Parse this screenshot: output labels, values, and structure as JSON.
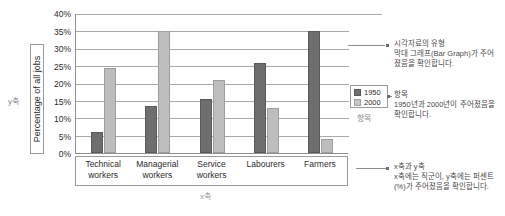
{
  "axes": {
    "y_outer_label": "y축",
    "y_title": "Percentage of all jobs",
    "x_outer_label": "x축"
  },
  "legend": {
    "items": [
      {
        "label": "1950",
        "color": "#6e6e6e"
      },
      {
        "label": "2000",
        "color": "#c6c6c6"
      }
    ],
    "caption": "항목"
  },
  "annotations": [
    {
      "title": "시각자료의 유형",
      "body": "막대 그래프(Bar Graph)가 주어졌음을 확인합니다."
    },
    {
      "title": "항목",
      "body": "1950년과 2000년이 주어졌음을 확인합니다."
    },
    {
      "title": "x축과 y축",
      "body": "x축에는 직군이, y축에는 퍼센트(%)가 주어졌음을 확인합니다."
    }
  ],
  "chart_data": {
    "type": "bar",
    "title": "",
    "xlabel": "x축",
    "ylabel": "Percentage of all jobs",
    "ylim": [
      0,
      40
    ],
    "ytick_labels": [
      "0%",
      "5%",
      "10%",
      "15%",
      "20%",
      "25%",
      "30%",
      "35%",
      "40%"
    ],
    "ytick_values": [
      0,
      5,
      10,
      15,
      20,
      25,
      30,
      35,
      40
    ],
    "grid": true,
    "legend_position": "right",
    "categories": [
      "Technical workers",
      "Managerial workers",
      "Service workers",
      "Labourers",
      "Farmers"
    ],
    "category_lines": [
      [
        "Technical",
        "workers"
      ],
      [
        "Managerial",
        "workers"
      ],
      [
        "Service",
        "workers"
      ],
      [
        "Labourers",
        ""
      ],
      [
        "Farmers",
        ""
      ]
    ],
    "series": [
      {
        "name": "1950",
        "color": "#6e6e6e",
        "values": [
          6,
          13.5,
          15.5,
          26,
          35
        ]
      },
      {
        "name": "2000",
        "color": "#bdbdbd",
        "values": [
          24.5,
          35,
          21,
          13,
          4
        ]
      }
    ]
  }
}
